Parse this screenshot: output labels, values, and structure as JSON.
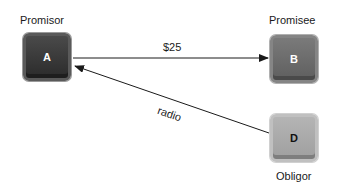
{
  "nodes": [
    {
      "id": "A",
      "letter": "A",
      "role": "Promisor"
    },
    {
      "id": "B",
      "letter": "B",
      "role": "Promisee"
    },
    {
      "id": "D",
      "letter": "D",
      "role": "Obligor"
    }
  ],
  "edges": [
    {
      "from": "A",
      "to": "B",
      "label": "$25"
    },
    {
      "from": "D",
      "to": "A",
      "label": "radio"
    }
  ],
  "colors": {
    "line": "#1a1a1a",
    "node_dark": "#333333",
    "node_mid": "#666666",
    "node_light": "#a8a8a8"
  }
}
